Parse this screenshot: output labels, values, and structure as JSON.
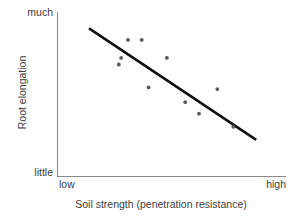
{
  "chart_data": {
    "type": "scatter",
    "title": "",
    "xlabel": "Soil strength (penetration resistance)",
    "ylabel": "Root elongation",
    "xtick_labels": [
      "low",
      "high"
    ],
    "ytick_labels": [
      "little",
      "much"
    ],
    "xlim": [
      0,
      100
    ],
    "ylim": [
      0,
      100
    ],
    "grid": false,
    "legend": "none",
    "point_color": "#5a5a5a",
    "line_color": "#111111",
    "axis_color": "#8a8a8a",
    "background_color": "#ffffff",
    "points": [
      {
        "x": 27,
        "y": 68
      },
      {
        "x": 31,
        "y": 83
      },
      {
        "x": 37,
        "y": 83
      },
      {
        "x": 28,
        "y": 72
      },
      {
        "x": 40,
        "y": 54
      },
      {
        "x": 48,
        "y": 72
      },
      {
        "x": 56,
        "y": 45
      },
      {
        "x": 62,
        "y": 38
      },
      {
        "x": 70,
        "y": 53
      },
      {
        "x": 77,
        "y": 30
      }
    ],
    "trendline": {
      "label": "fitted line",
      "x_start": 14,
      "y_start": 90,
      "x_end": 87,
      "y_end": 22
    },
    "relationship": "negative",
    "n_points": 10
  }
}
